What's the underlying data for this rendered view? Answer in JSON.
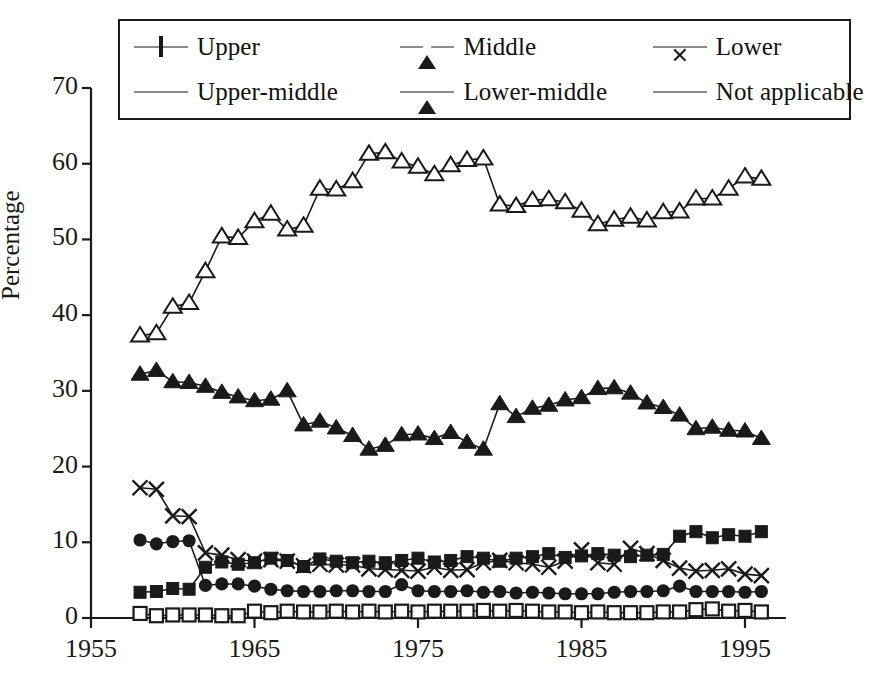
{
  "chart_data": {
    "type": "line",
    "title": "",
    "xlabel": "",
    "ylabel": "Percentage",
    "xlim": [
      1955,
      1997.5
    ],
    "ylim": [
      0,
      70
    ],
    "xticks": [
      1955,
      1965,
      1975,
      1985,
      1995
    ],
    "xtick_labels": [
      "1955",
      "1965",
      "1975",
      "1985",
      "1995"
    ],
    "yticks": [
      0,
      10,
      20,
      30,
      40,
      50,
      60,
      70
    ],
    "ytick_labels": [
      "0",
      "10",
      "20",
      "30",
      "40",
      "50",
      "60",
      "70"
    ],
    "grid": false,
    "legend_position": "top",
    "legend_columns": 3,
    "legend_rows": 2,
    "x": [
      1958,
      1959,
      1960,
      1961,
      1962,
      1963,
      1964,
      1965,
      1966,
      1967,
      1968,
      1969,
      1970,
      1971,
      1972,
      1973,
      1974,
      1975,
      1976,
      1977,
      1978,
      1979,
      1980,
      1981,
      1982,
      1983,
      1984,
      1985,
      1986,
      1987,
      1988,
      1989,
      1990,
      1991,
      1992,
      1993,
      1994,
      1995,
      1996
    ],
    "series": [
      {
        "name": "Upper",
        "marker": "open-square",
        "fill": "none",
        "color": "#1a1a1a",
        "values": [
          0.6,
          0.3,
          0.4,
          0.4,
          0.4,
          0.3,
          0.3,
          0.9,
          0.7,
          0.9,
          0.8,
          0.8,
          0.9,
          0.8,
          0.9,
          0.8,
          0.9,
          0.8,
          0.9,
          0.9,
          0.9,
          1.0,
          0.9,
          1.0,
          0.9,
          0.8,
          0.8,
          0.7,
          0.8,
          0.7,
          0.7,
          0.7,
          0.8,
          0.8,
          1.1,
          1.2,
          0.9,
          1.0,
          0.8
        ]
      },
      {
        "name": "Middle",
        "marker": "open-triangle",
        "fill": "none",
        "color": "#1a1a1a",
        "values": [
          37.3,
          37.6,
          41.1,
          41.6,
          45.8,
          50.4,
          50.2,
          52.4,
          53.4,
          51.3,
          51.8,
          56.7,
          56.6,
          57.7,
          61.3,
          61.5,
          60.3,
          59.6,
          58.6,
          59.8,
          60.5,
          60.7,
          54.6,
          54.4,
          55.2,
          55.3,
          54.9,
          53.8,
          52.0,
          52.6,
          53.0,
          52.5,
          53.6,
          53.7,
          55.4,
          55.4,
          56.7,
          58.3,
          58.0
        ]
      },
      {
        "name": "Lower",
        "marker": "cross",
        "fill": "none",
        "color": "#1a1a1a",
        "values": [
          17.2,
          17.0,
          13.5,
          13.4,
          8.6,
          8.3,
          7.7,
          7.5,
          7.7,
          7.5,
          6.9,
          7.1,
          7.0,
          7.0,
          6.5,
          6.4,
          6.3,
          6.2,
          6.7,
          6.3,
          6.4,
          7.3,
          7.6,
          7.3,
          7.1,
          6.7,
          7.5,
          9.0,
          7.3,
          7.1,
          9.2,
          8.5,
          7.6,
          6.6,
          6.2,
          6.3,
          6.5,
          5.8,
          5.6
        ]
      },
      {
        "name": "Upper-middle",
        "marker": "filled-square",
        "fill": "solid",
        "color": "#1a1a1a",
        "values": [
          3.4,
          3.5,
          3.9,
          3.8,
          6.7,
          7.4,
          7.1,
          7.3,
          7.9,
          7.6,
          6.8,
          7.8,
          7.5,
          7.3,
          7.5,
          7.3,
          7.6,
          7.9,
          7.4,
          7.6,
          8.1,
          7.9,
          7.5,
          7.9,
          8.1,
          8.5,
          8.0,
          8.2,
          8.5,
          8.3,
          8.1,
          8.3,
          8.4,
          10.8,
          11.4,
          10.6,
          11.0,
          10.8,
          11.4
        ]
      },
      {
        "name": "Lower-middle",
        "marker": "filled-triangle",
        "fill": "solid",
        "color": "#1a1a1a",
        "values": [
          32.2,
          32.7,
          31.2,
          31.1,
          30.6,
          29.8,
          29.2,
          28.7,
          28.9,
          30.0,
          25.5,
          26.0,
          25.1,
          24.1,
          22.3,
          22.8,
          24.2,
          24.3,
          23.7,
          24.5,
          23.2,
          22.3,
          28.3,
          26.6,
          27.7,
          28.1,
          28.8,
          29.1,
          30.3,
          30.4,
          29.7,
          28.4,
          27.8,
          26.8,
          25.0,
          25.2,
          24.8,
          24.7,
          23.7
        ]
      },
      {
        "name": "Not applicable",
        "marker": "filled-circle",
        "fill": "solid",
        "color": "#1a1a1a",
        "values": [
          10.3,
          9.8,
          10.1,
          10.2,
          4.3,
          4.5,
          4.5,
          4.2,
          3.8,
          3.6,
          3.5,
          3.5,
          3.6,
          3.6,
          3.5,
          3.5,
          4.4,
          3.6,
          3.5,
          3.5,
          3.6,
          3.4,
          3.5,
          3.3,
          3.4,
          3.3,
          3.2,
          3.2,
          3.2,
          3.4,
          3.5,
          3.5,
          3.6,
          4.2,
          3.5,
          3.5,
          3.5,
          3.4,
          3.5
        ]
      }
    ]
  },
  "legend": {
    "rows": [
      [
        {
          "label": "Upper",
          "marker": "open-square"
        },
        {
          "label": "Middle",
          "marker": "open-triangle"
        },
        {
          "label": "Lower",
          "marker": "cross"
        }
      ],
      [
        {
          "label": "Upper-middle",
          "marker": "filled-square"
        },
        {
          "label": "Lower-middle",
          "marker": "filled-triangle"
        },
        {
          "label": "Not applicable",
          "marker": "filled-circle"
        }
      ]
    ]
  },
  "axes": {
    "y_title": "Percentage"
  },
  "colors": {
    "ink": "#1a1a1a",
    "background": "#ffffff"
  }
}
